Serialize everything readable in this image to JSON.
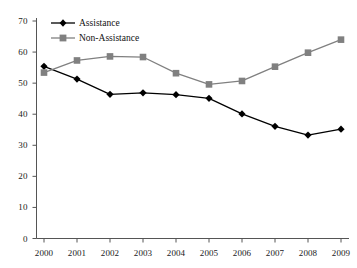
{
  "chart_data": {
    "type": "line",
    "title": "",
    "subtitle": "",
    "xlabel": "",
    "ylabel": "",
    "categories": [
      "2000",
      "2001",
      "2002",
      "2003",
      "2004",
      "2005",
      "2006",
      "2007",
      "2008",
      "2009"
    ],
    "x": [
      2000,
      2001,
      2002,
      2003,
      2004,
      2005,
      2006,
      2007,
      2008,
      2009
    ],
    "xlim": [
      2000,
      2009
    ],
    "ylim": [
      0,
      70
    ],
    "y_ticks": [
      0,
      10,
      20,
      30,
      40,
      50,
      60,
      70
    ],
    "y_tick_labels": [
      "0",
      "10",
      "20",
      "30",
      "40",
      "50",
      "60",
      "70"
    ],
    "x_tick_labels": [
      "2000",
      "2001",
      "2002",
      "2003",
      "2004",
      "2005",
      "2006",
      "2007",
      "2008",
      "2009"
    ],
    "grid": false,
    "legend_position": "top-left",
    "series": [
      {
        "name": "Assistance",
        "color": "#000000",
        "marker": "diamond",
        "values": [
          55.4,
          51.3,
          46.4,
          46.9,
          46.3,
          45.1,
          40.1,
          36.1,
          33.3,
          35.2
        ]
      },
      {
        "name": "Non-Assistance",
        "color": "#808080",
        "marker": "square",
        "values": [
          53.4,
          57.3,
          58.6,
          58.4,
          53.2,
          49.6,
          50.7,
          55.3,
          59.8,
          64.0
        ]
      }
    ],
    "annotations": []
  },
  "legend": {
    "entries": [
      {
        "label": "Assistance"
      },
      {
        "label": "Non-Assistance"
      }
    ]
  },
  "axes": {
    "y_axis_name": "value-axis",
    "x_axis_name": "year-axis"
  }
}
